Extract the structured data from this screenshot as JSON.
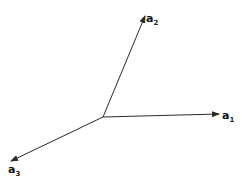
{
  "diagram": {
    "title": "",
    "colors": {
      "line": "#2a2a2a",
      "background": "#ffffff"
    },
    "origin": {
      "x": 103,
      "y": 117
    },
    "vectors": [
      {
        "id": "a1",
        "base": "a",
        "subscript": "1",
        "tip": {
          "x": 219,
          "y": 114
        },
        "label_pos": {
          "x": 222,
          "y": 119
        }
      },
      {
        "id": "a2",
        "base": "a",
        "subscript": "2",
        "tip": {
          "x": 145,
          "y": 16
        },
        "label_pos": {
          "x": 146,
          "y": 22
        }
      },
      {
        "id": "a3",
        "base": "a",
        "subscript": "3",
        "tip": {
          "x": 11,
          "y": 161
        },
        "label_pos": {
          "x": 8,
          "y": 173
        }
      }
    ]
  }
}
